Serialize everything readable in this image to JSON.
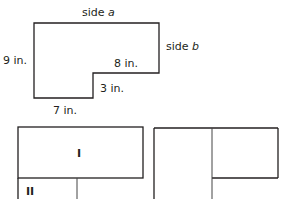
{
  "figure_top": {
    "labels": {
      "side_a_prefix": "side ",
      "side_a_var": "a",
      "side_b_prefix": "side ",
      "side_b_var": "b",
      "left": "9 in.",
      "inner_horizontal": "8 in.",
      "inner_vertical": "3 in.",
      "bottom": "7 in."
    }
  },
  "figure_bottom_left": {
    "region_labels": [
      "I",
      "II"
    ]
  },
  "figure_bottom_right": {
    "region_labels": []
  }
}
